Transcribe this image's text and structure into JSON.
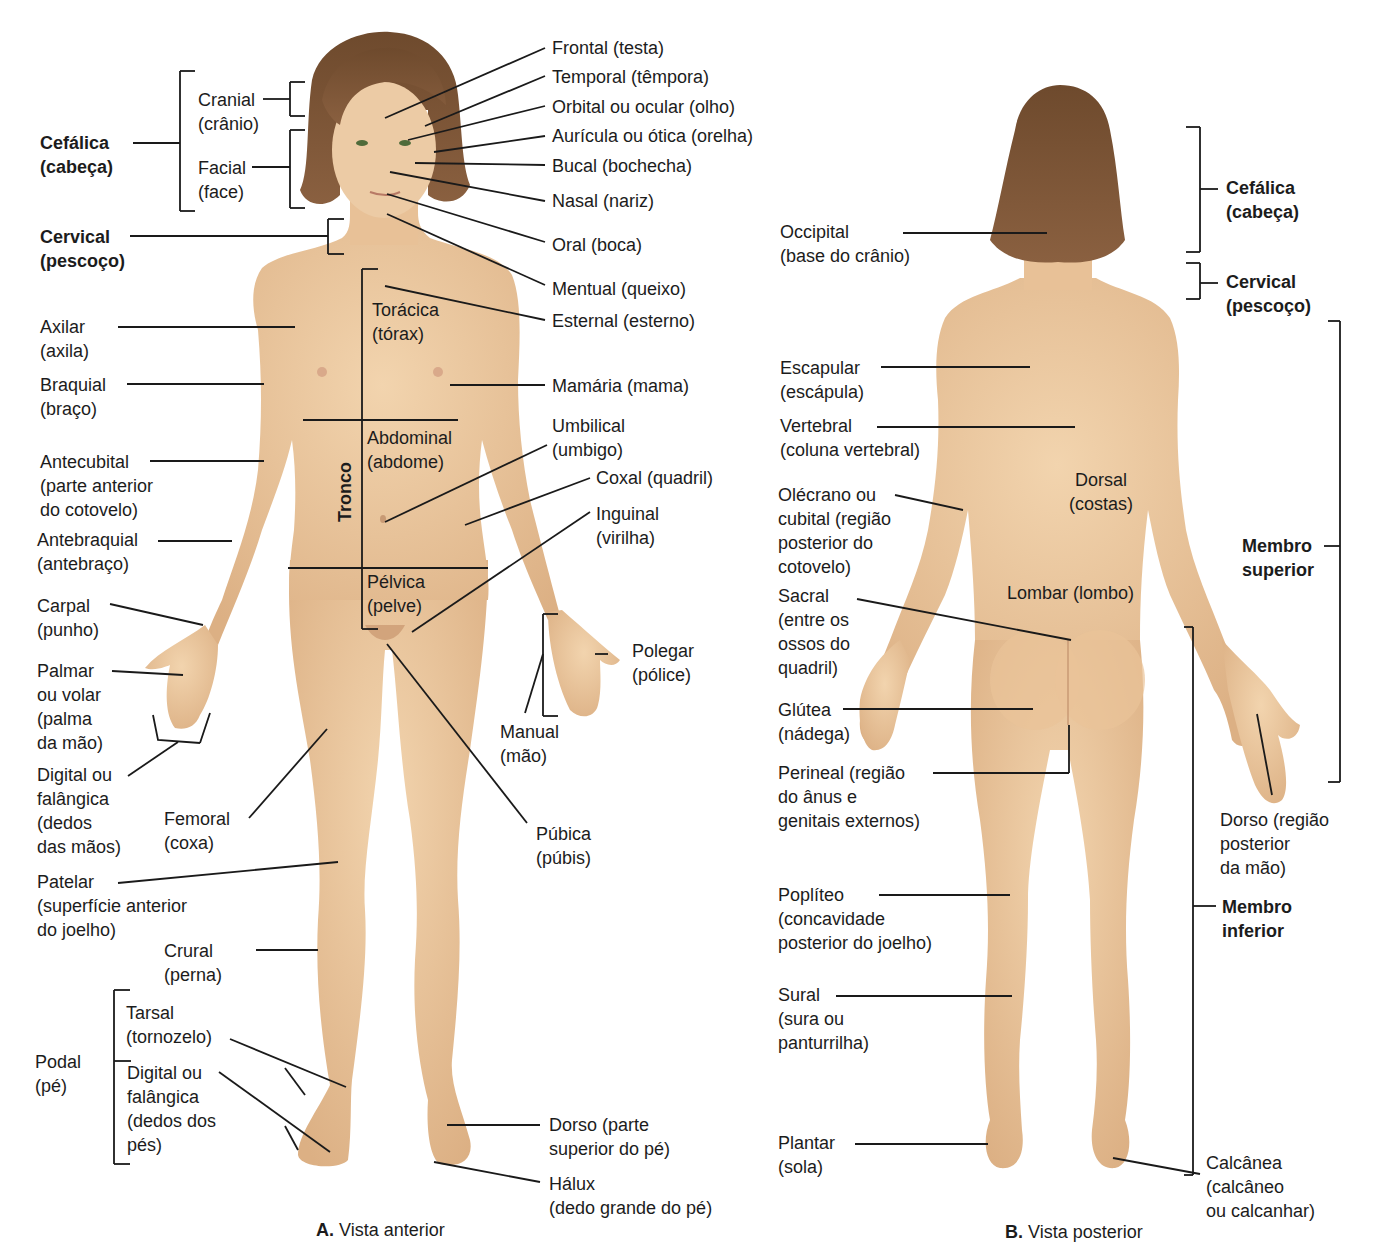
{
  "colors": {
    "skin": "#ecc9a0",
    "skin_shade": "#d9ac7c",
    "skin_light": "#f3d8b5",
    "hair": "#7a5233",
    "hair_dark": "#5e3d25",
    "line": "#1a1a1a",
    "text": "#1c1c1c",
    "background": "#ffffff"
  },
  "anterior": {
    "caption_letter": "A.",
    "caption_text": " Vista anterior",
    "caption_pos": [
      296,
      1194
    ],
    "tronco_label": "Tronco",
    "labels": [
      {
        "id": "cefalica",
        "lines": [
          "Cefálica",
          "(cabeça)"
        ],
        "x": 40,
        "y": 131,
        "bold": true
      },
      {
        "id": "cranial",
        "lines": [
          "Cranial",
          "(crânio)"
        ],
        "x": 198,
        "y": 88,
        "bold": false
      },
      {
        "id": "facial",
        "lines": [
          "Facial",
          "(face)"
        ],
        "x": 198,
        "y": 156,
        "bold": false
      },
      {
        "id": "cervical",
        "lines": [
          "Cervical",
          "(pescoço)"
        ],
        "x": 40,
        "y": 225,
        "bold": true
      },
      {
        "id": "frontal",
        "lines": [
          "Frontal (testa)"
        ],
        "x": 552,
        "y": 36,
        "bold": false
      },
      {
        "id": "temporal",
        "lines": [
          "Temporal (têmpora)"
        ],
        "x": 552,
        "y": 65,
        "bold": false
      },
      {
        "id": "orbital",
        "lines": [
          "Orbital ou ocular (olho)"
        ],
        "x": 552,
        "y": 95,
        "bold": false
      },
      {
        "id": "auricula",
        "lines": [
          "Aurícula ou ótica (orelha)"
        ],
        "x": 552,
        "y": 124,
        "bold": false
      },
      {
        "id": "bucal",
        "lines": [
          "Bucal (bochecha)"
        ],
        "x": 552,
        "y": 154,
        "bold": false
      },
      {
        "id": "nasal",
        "lines": [
          "Nasal (nariz)"
        ],
        "x": 552,
        "y": 189,
        "bold": false
      },
      {
        "id": "oral",
        "lines": [
          "Oral (boca)"
        ],
        "x": 552,
        "y": 233,
        "bold": false
      },
      {
        "id": "mentual",
        "lines": [
          "Mentual (queixo)"
        ],
        "x": 552,
        "y": 277,
        "bold": false
      },
      {
        "id": "esternal",
        "lines": [
          "Esternal (esterno)"
        ],
        "x": 552,
        "y": 309,
        "bold": false
      },
      {
        "id": "toracica",
        "lines": [
          "Torácica",
          "(tórax)"
        ],
        "x": 372,
        "y": 298,
        "bold": false
      },
      {
        "id": "mamaria",
        "lines": [
          "Mamária (mama)"
        ],
        "x": 552,
        "y": 374,
        "bold": false
      },
      {
        "id": "abdominal",
        "lines": [
          "Abdominal",
          "(abdome)"
        ],
        "x": 367,
        "y": 426,
        "bold": false
      },
      {
        "id": "umbilical",
        "lines": [
          "Umbilical",
          "(umbigo)"
        ],
        "x": 552,
        "y": 414,
        "bold": false
      },
      {
        "id": "coxal",
        "lines": [
          "Coxal (quadril)"
        ],
        "x": 596,
        "y": 466,
        "bold": false
      },
      {
        "id": "inguinal",
        "lines": [
          "Inguinal",
          "(virilha)"
        ],
        "x": 596,
        "y": 502,
        "bold": false
      },
      {
        "id": "pelvica",
        "lines": [
          "Pélvica",
          "(pelve)"
        ],
        "x": 367,
        "y": 570,
        "bold": false
      },
      {
        "id": "axilar",
        "lines": [
          "Axilar",
          "(axila)"
        ],
        "x": 40,
        "y": 315,
        "bold": false
      },
      {
        "id": "braquial",
        "lines": [
          "Braquial",
          "(braço)"
        ],
        "x": 40,
        "y": 373,
        "bold": false
      },
      {
        "id": "antecubital",
        "lines": [
          "Antecubital",
          "(parte anterior",
          "do cotovelo)"
        ],
        "x": 40,
        "y": 450,
        "bold": false
      },
      {
        "id": "antebraquial",
        "lines": [
          "Antebraquial",
          "(antebraço)"
        ],
        "x": 37,
        "y": 528,
        "bold": false
      },
      {
        "id": "carpal",
        "lines": [
          "Carpal",
          "(punho)"
        ],
        "x": 37,
        "y": 594,
        "bold": false
      },
      {
        "id": "palmar",
        "lines": [
          "Palmar",
          "ou volar",
          "(palma",
          "da mão)"
        ],
        "x": 37,
        "y": 659,
        "bold": false
      },
      {
        "id": "digital_mao",
        "lines": [
          "Digital ou",
          "falângica",
          "(dedos",
          "das mãos)"
        ],
        "x": 37,
        "y": 763,
        "bold": false
      },
      {
        "id": "femoral",
        "lines": [
          "Femoral",
          "(coxa)"
        ],
        "x": 164,
        "y": 807,
        "bold": false
      },
      {
        "id": "polegar",
        "lines": [
          "Polegar",
          "(pólice)"
        ],
        "x": 632,
        "y": 639,
        "bold": false
      },
      {
        "id": "manual",
        "lines": [
          "Manual",
          "(mão)"
        ],
        "x": 500,
        "y": 720,
        "bold": false
      },
      {
        "id": "pubica",
        "lines": [
          "Púbica",
          "(púbis)"
        ],
        "x": 536,
        "y": 822,
        "bold": false
      },
      {
        "id": "patelar",
        "lines": [
          "Patelar",
          "(superfície anterior",
          "do joelho)"
        ],
        "x": 37,
        "y": 870,
        "bold": false
      },
      {
        "id": "crural",
        "lines": [
          "Crural",
          "(perna)"
        ],
        "x": 164,
        "y": 939,
        "bold": false
      },
      {
        "id": "tarsal",
        "lines": [
          "Tarsal",
          "(tornozelo)"
        ],
        "x": 126,
        "y": 1001,
        "bold": false
      },
      {
        "id": "podal",
        "lines": [
          "Podal",
          "(pé)"
        ],
        "x": 35,
        "y": 1050,
        "bold": false
      },
      {
        "id": "digital_pe",
        "lines": [
          "Digital ou",
          "falângica",
          "(dedos dos",
          "pés)"
        ],
        "x": 127,
        "y": 1061,
        "bold": false
      },
      {
        "id": "dorso_pe",
        "lines": [
          "Dorso (parte",
          "superior do pé)"
        ],
        "x": 549,
        "y": 1113,
        "bold": false
      },
      {
        "id": "halux",
        "lines": [
          "Hálux",
          "(dedo grande do pé)"
        ],
        "x": 549,
        "y": 1172,
        "bold": false
      }
    ]
  },
  "posterior": {
    "caption_letter": "B.",
    "caption_text": " Vista posterior",
    "caption_pos": [
      985,
      1196
    ],
    "labels": [
      {
        "id": "occipital",
        "lines": [
          "Occipital",
          "(base do crânio)"
        ],
        "x": 780,
        "y": 220,
        "bold": false
      },
      {
        "id": "cefalica_b",
        "lines": [
          "Cefálica",
          "(cabeça)"
        ],
        "x": 1226,
        "y": 176,
        "bold": true
      },
      {
        "id": "cervical_b",
        "lines": [
          "Cervical",
          "(pescoço)"
        ],
        "x": 1226,
        "y": 270,
        "bold": true
      },
      {
        "id": "escapular",
        "lines": [
          "Escapular",
          "(escápula)"
        ],
        "x": 780,
        "y": 356,
        "bold": false
      },
      {
        "id": "vertebral",
        "lines": [
          "Vertebral",
          "(coluna vertebral)"
        ],
        "x": 780,
        "y": 414,
        "bold": false
      },
      {
        "id": "dorsal",
        "lines": [
          "Dorsal",
          "(costas)"
        ],
        "x": 1046,
        "y": 468,
        "bold": false,
        "align": "center",
        "w": 110
      },
      {
        "id": "olecrano",
        "lines": [
          "Olécrano ou",
          "cubital (região",
          "posterior do",
          "cotovelo)"
        ],
        "x": 778,
        "y": 483,
        "bold": false
      },
      {
        "id": "membro_sup",
        "lines": [
          "Membro",
          "superior"
        ],
        "x": 1242,
        "y": 534,
        "bold": true
      },
      {
        "id": "lombar",
        "lines": [
          "Lombar (lombo)"
        ],
        "x": 1007,
        "y": 581,
        "bold": false
      },
      {
        "id": "sacral",
        "lines": [
          "Sacral",
          "(entre os",
          "ossos do",
          "quadril)"
        ],
        "x": 778,
        "y": 584,
        "bold": false
      },
      {
        "id": "glutea",
        "lines": [
          "Glútea",
          "(nádega)"
        ],
        "x": 778,
        "y": 698,
        "bold": false
      },
      {
        "id": "perineal",
        "lines": [
          "Perineal (região",
          "do ânus e",
          "genitais externos)"
        ],
        "x": 778,
        "y": 761,
        "bold": false
      },
      {
        "id": "dorso_mao",
        "lines": [
          "Dorso (região",
          "posterior",
          "da mão)"
        ],
        "x": 1220,
        "y": 808,
        "bold": false
      },
      {
        "id": "popliteo",
        "lines": [
          "Poplíteo",
          "(concavidade",
          "posterior do joelho)"
        ],
        "x": 778,
        "y": 883,
        "bold": false
      },
      {
        "id": "membro_inf",
        "lines": [
          "Membro",
          "inferior"
        ],
        "x": 1222,
        "y": 895,
        "bold": true
      },
      {
        "id": "sural",
        "lines": [
          "Sural",
          "(sura ou",
          "panturrilha)"
        ],
        "x": 778,
        "y": 983,
        "bold": false
      },
      {
        "id": "plantar",
        "lines": [
          "Plantar",
          "(sola)"
        ],
        "x": 778,
        "y": 1131,
        "bold": false
      },
      {
        "id": "calcanea",
        "lines": [
          "Calcânea",
          "(calcâneo",
          "ou calcanhar)"
        ],
        "x": 1206,
        "y": 1151,
        "bold": false
      }
    ]
  },
  "leaders": [
    "M133 143 L180 143",
    "M180 71 L180 211",
    "M180 71 L195 71",
    "M180 211 L195 211",
    "M263 99 L290 99",
    "M290 82 L290 116",
    "M290 82 L305 82",
    "M290 116 L305 116",
    "M252 167 L290 167",
    "M290 130 L290 208",
    "M290 130 L305 130",
    "M290 208 L305 208",
    "M130 236 L328 236",
    "M328 219 L328 254",
    "M328 219 L344 219",
    "M328 254 L344 254",
    "M545 48 L385 118",
    "M545 76 L425 126",
    "M545 106 L408 140",
    "M545 136 L434 152",
    "M545 165 L415 163",
    "M545 201 L390 172",
    "M545 242 L387 194",
    "M545 285 L387 214",
    "M545 320 L385 286",
    "M362 269 L362 629",
    "M362 269 L378 269",
    "M362 629 L378 629",
    "M545 385 L450 385",
    "M303 420 L458 420",
    "M288 568 L488 568",
    "M547 445 L385 522",
    "M590 478 L465 525",
    "M590 512 L412 632",
    "M118 327 L295 327",
    "M127 384 L264 384",
    "M150 461 L264 461",
    "M158 541 L232 541",
    "M110 604 L203 625",
    "M112 671 L183 675",
    "M153 715 L158 740 L200 743",
    "M210 713 L200 743",
    "M178 742 L128 776",
    "M249 818 L327 729",
    "M595 654 L608 654",
    "M543 614 L543 716",
    "M543 614 L558 614",
    "M543 716 L558 716",
    "M543 654 L525 713",
    "M527 823 L387 644",
    "M118 883 L338 862",
    "M256 950 L318 950",
    "M131 1061 L114 1061",
    "M114 990 L114 1164",
    "M114 990 L130 990",
    "M114 1164 L130 1164",
    "M230 1039 L346 1087",
    "M285 1068 L305 1095",
    "M219 1072 L330 1152",
    "M285 1126 L298 1150",
    "M540 1125 L447 1125",
    "M540 1182 L434 1162",
    "M903 233 L1047 233",
    "M1186 127 L1200 127",
    "M1200 127 L1200 252",
    "M1186 252 L1200 252",
    "M1200 189 L1218 189",
    "M1186 263 L1200 263",
    "M1200 263 L1200 299",
    "M1186 299 L1200 299",
    "M1200 283 L1218 283",
    "M1328 321 L1340 321",
    "M1340 321 L1340 782",
    "M1328 782 L1340 782",
    "M1324 546 L1340 546",
    "M881 367 L1030 367",
    "M877 427 L1075 427",
    "M895 495 L963 510",
    "M857 599 L1071 640",
    "M843 709 L1033 709",
    "M933 773 L1069 773",
    "M1069 725 L1069 773",
    "M879 895 L1010 895",
    "M836 996 L1012 996",
    "M855 1144 L988 1144",
    "M1184 627 L1193 627",
    "M1193 627 L1193 1175",
    "M1184 1175 L1193 1175",
    "M1193 906 L1216 906",
    "M1257 714 L1272 795",
    "M1200 1174 L1113 1158"
  ]
}
